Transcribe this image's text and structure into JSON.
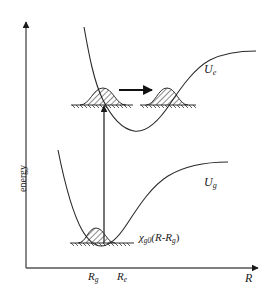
{
  "figure": {
    "name": "potential-energy-curves-wavepacket-diagram",
    "background_color": "#ffffff",
    "line_color": "#1a1a1a",
    "axes": {
      "y_label": "energy",
      "x_label": "R",
      "x_tick_labels": [
        {
          "base": "R",
          "sub": "g"
        },
        {
          "base": "R",
          "sub": "e"
        }
      ]
    },
    "curves": [
      {
        "name": "excited-state-potential",
        "label_base": "U",
        "label_sub": "e"
      },
      {
        "name": "ground-state-potential",
        "label_base": "U",
        "label_sub": "g"
      }
    ],
    "wavefunction_label": {
      "chi": "χ",
      "sub": "g0",
      "argument": "(R-R",
      "arg_sub": "g",
      "close": ")"
    },
    "annotations": {
      "vertical_transition_arrow": "upward-excitation-arrow",
      "horizontal_motion_arrow": "wavepacket-propagation-arrow"
    },
    "wavepackets": [
      {
        "name": "ground-state-wavepacket",
        "hatched": true
      },
      {
        "name": "excited-state-wavepacket-initial",
        "hatched": true
      },
      {
        "name": "excited-state-wavepacket-propagated",
        "hatched": true
      }
    ]
  }
}
